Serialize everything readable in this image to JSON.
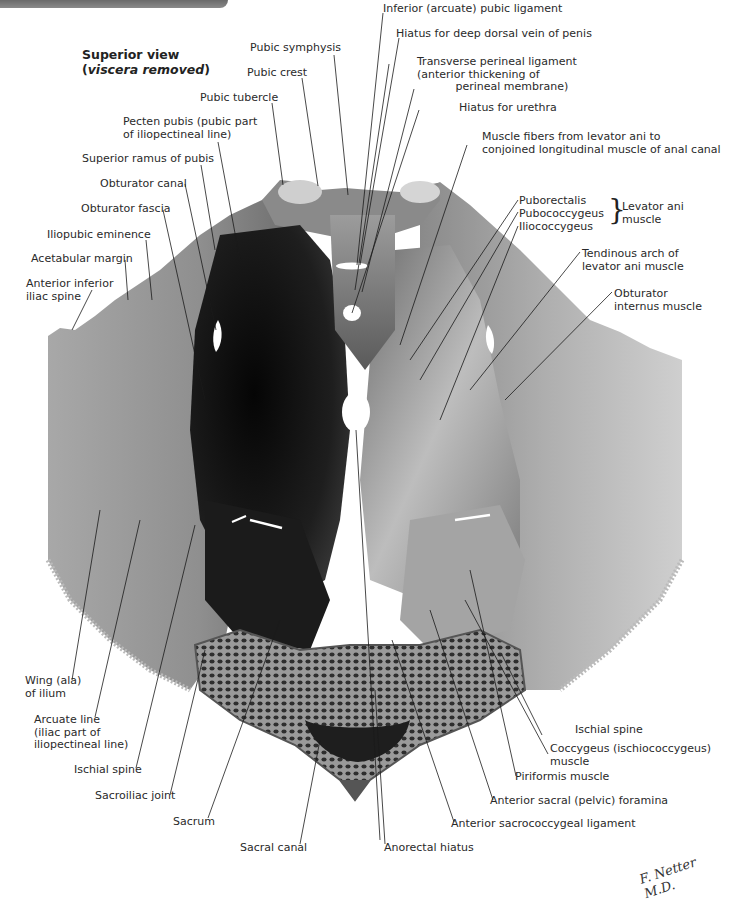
{
  "figure": {
    "title": "Superior view",
    "subtitle_open": "(",
    "subtitle_italic": "viscera removed",
    "subtitle_close": ")",
    "signature": "F. Netter M.D."
  },
  "labels_top": [
    {
      "id": "pubic-symphysis",
      "text": "Pubic symphysis"
    },
    {
      "id": "pubic-crest",
      "text": "Pubic crest"
    },
    {
      "id": "pubic-tubercle",
      "text": "Pubic tubercle"
    },
    {
      "id": "inferior-pubic-ligament",
      "text": "Inferior (arcuate) pubic ligament"
    },
    {
      "id": "hiatus-dorsal-vein",
      "text": "Hiatus for deep dorsal vein of penis"
    },
    {
      "id": "transverse-perineal-ligament",
      "text": "Transverse perineal ligament\n(anterior thickening of\n           perineal membrane)"
    },
    {
      "id": "hiatus-urethra",
      "text": "Hiatus for urethra"
    },
    {
      "id": "muscle-fibers-levator",
      "text": "Muscle fibers from levator ani to\nconjoined longitudinal muscle of anal canal"
    }
  ],
  "labels_left": [
    {
      "id": "pecten-pubis",
      "text": "Pecten pubis (pubic part\nof iliopectineal line)"
    },
    {
      "id": "superior-ramus-pubis",
      "text": "Superior ramus of pubis"
    },
    {
      "id": "obturator-canal",
      "text": "Obturator canal"
    },
    {
      "id": "obturator-fascia",
      "text": "Obturator fascia"
    },
    {
      "id": "iliopubic-eminence",
      "text": "Iliopubic eminence"
    },
    {
      "id": "acetabular-margin",
      "text": "Acetabular margin"
    },
    {
      "id": "anterior-inferior-iliac-spine",
      "text": "Anterior inferior\niliac spine"
    },
    {
      "id": "wing-of-ilium",
      "text": "Wing (ala)\nof ilium"
    },
    {
      "id": "arcuate-line",
      "text": "Arcuate line\n(iliac part of\niliopectineal line)"
    },
    {
      "id": "ischial-spine-left",
      "text": "Ischial spine"
    },
    {
      "id": "sacroiliac-joint",
      "text": "Sacroiliac joint"
    },
    {
      "id": "sacrum",
      "text": "Sacrum"
    }
  ],
  "labels_right": [
    {
      "id": "puborectalis",
      "text": "Puborectalis"
    },
    {
      "id": "pubococcygeus",
      "text": "Pubococcygeus"
    },
    {
      "id": "iliococcygeus",
      "text": "Iliococcygeus"
    },
    {
      "id": "levator-ani-group",
      "text": "Levator ani\nmuscle"
    },
    {
      "id": "tendinous-arch",
      "text": "Tendinous arch of\nlevator ani muscle"
    },
    {
      "id": "obturator-internus",
      "text": "Obturator\ninternus muscle"
    },
    {
      "id": "ischial-spine-right",
      "text": "Ischial spine"
    },
    {
      "id": "coccygeus",
      "text": "Coccygeus (ischiococcygeus)\nmuscle"
    },
    {
      "id": "piriformis",
      "text": "Piriformis muscle"
    },
    {
      "id": "anterior-sacral-foramina",
      "text": "Anterior sacral (pelvic) foramina"
    },
    {
      "id": "anterior-sacrococcygeal-ligament",
      "text": "Anterior sacrococcygeal ligament"
    }
  ],
  "labels_bottom": [
    {
      "id": "sacral-canal",
      "text": "Sacral canal"
    },
    {
      "id": "anorectal-hiatus",
      "text": "Anorectal hiatus"
    }
  ],
  "colors": {
    "background": "#ffffff",
    "bone_light": "#c9c9c9",
    "bone_mid": "#9a9a9a",
    "muscle_dark": "#141414",
    "muscle_light": "#b8b8b8",
    "leader_line": "#1a1a1a",
    "banner": "#7a7a7a"
  }
}
